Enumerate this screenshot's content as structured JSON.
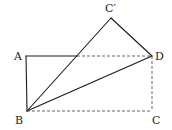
{
  "diagram": {
    "type": "geometry-fold",
    "points": {
      "A": {
        "label": "A",
        "x": 26,
        "y": 56
      },
      "B": {
        "label": "B",
        "x": 27,
        "y": 111
      },
      "C": {
        "label": "C",
        "x": 152,
        "y": 111
      },
      "D": {
        "label": "D",
        "x": 152,
        "y": 56
      },
      "C_prime": {
        "label": "C′",
        "x": 111,
        "y": 18
      },
      "E": {
        "label": "",
        "x": 77,
        "y": 56
      }
    },
    "solid_segments": [
      [
        "A",
        "B"
      ],
      [
        "A",
        "E"
      ],
      [
        "B",
        "C_prime"
      ],
      [
        "C_prime",
        "D"
      ],
      [
        "B",
        "D"
      ]
    ],
    "dashed_segments": [
      [
        "E",
        "D"
      ],
      [
        "D",
        "C"
      ],
      [
        "B",
        "C"
      ]
    ],
    "colors": {
      "solid": "#1a1a1a",
      "dashed": "#555555",
      "label": "#222222",
      "background": "#ffffff"
    }
  },
  "labels": {
    "A": "A",
    "B": "B",
    "C": "C",
    "D": "D",
    "C_prime": "C′"
  }
}
